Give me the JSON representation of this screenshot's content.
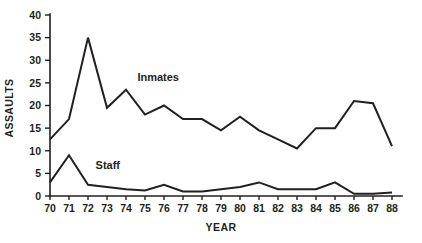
{
  "chart_data": {
    "type": "line",
    "title": "",
    "xlabel": "YEAR",
    "ylabel": "ASSAULTS",
    "xlim": [
      70,
      88
    ],
    "ylim": [
      0,
      40
    ],
    "grid": false,
    "legend_position": "inline-annotation",
    "x": [
      70,
      71,
      72,
      73,
      74,
      75,
      76,
      77,
      78,
      79,
      80,
      81,
      82,
      83,
      84,
      85,
      86,
      87,
      88
    ],
    "categories": [
      "70",
      "71",
      "72",
      "73",
      "74",
      "75",
      "76",
      "77",
      "78",
      "79",
      "80",
      "81",
      "82",
      "83",
      "84",
      "85",
      "86",
      "87",
      "88"
    ],
    "y_ticks": [
      0,
      5,
      10,
      15,
      20,
      25,
      30,
      35,
      40
    ],
    "y_tick_labels": [
      "0",
      "5",
      "10",
      "15",
      "20",
      "25",
      "30",
      "35",
      "40"
    ],
    "x_ticks": [
      70,
      71,
      72,
      73,
      74,
      75,
      76,
      77,
      78,
      79,
      80,
      81,
      82,
      83,
      84,
      85,
      86,
      87,
      88
    ],
    "x_tick_labels": [
      "70",
      "71",
      "72",
      "73",
      "74",
      "75",
      "76",
      "77",
      "78",
      "79",
      "80",
      "81",
      "82",
      "83",
      "84",
      "85",
      "86",
      "87",
      "88"
    ],
    "series": [
      {
        "name": "Inmates",
        "label": "Inmates",
        "color": "#231f20",
        "values": [
          12.5,
          17.0,
          35.0,
          19.5,
          23.5,
          18.0,
          20.0,
          17.0,
          17.0,
          14.5,
          17.5,
          14.5,
          12.5,
          10.5,
          15.0,
          15.0,
          21.0,
          20.5,
          11.0
        ],
        "annotation": {
          "text": "Inmates",
          "x": 74.6,
          "y": 25.5
        }
      },
      {
        "name": "Staff",
        "label": "Staff",
        "color": "#231f20",
        "values": [
          3.0,
          9.0,
          2.5,
          2.0,
          1.5,
          1.2,
          2.5,
          1.0,
          1.0,
          1.5,
          2.0,
          3.0,
          1.5,
          1.5,
          1.5,
          3.0,
          0.5,
          0.5,
          0.8
        ],
        "annotation": {
          "text": "Staff",
          "x": 72.4,
          "y": 6.0
        }
      }
    ]
  }
}
